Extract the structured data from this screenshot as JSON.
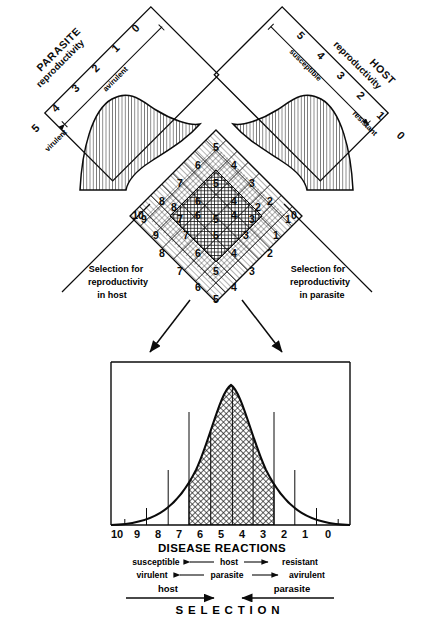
{
  "figure": {
    "panels": {
      "parasite": {
        "name": "PARASITE",
        "axis_label": "reproductivity",
        "ticks": [
          "5",
          "4",
          "3",
          "2",
          "1",
          "0"
        ],
        "low_end_label": "virulent",
        "high_end_label": "avirulent",
        "curve_fill": "diagonal-hatch"
      },
      "host": {
        "name": "HOST",
        "axis_label": "reproductivity",
        "ticks": [
          "5",
          "4",
          "3",
          "2",
          "1",
          "0"
        ],
        "low_end_label": "susceptible",
        "high_end_label": "resistant",
        "curve_fill": "diagonal-hatch"
      }
    },
    "lattice": {
      "note": "Diamond matrix of disease reaction classes; value = parasite index + host index",
      "rows": [
        [
          "5"
        ],
        [
          "6",
          "4"
        ],
        [
          "7",
          "5",
          "3"
        ],
        [
          "8",
          "6",
          "4",
          "2"
        ],
        [
          "9",
          "7",
          "5",
          "3",
          "1"
        ],
        [
          "10",
          "8",
          "6",
          "4",
          "2",
          "0"
        ],
        [
          "9",
          "7",
          "5",
          "3",
          "1"
        ],
        [
          "8",
          "6",
          "4",
          "2"
        ],
        [
          "7",
          "5",
          "3"
        ],
        [
          "6",
          "4"
        ],
        [
          "5"
        ]
      ]
    },
    "selection_left": {
      "line1": "Selection for",
      "line2": "reproductivity",
      "line3": "in host"
    },
    "selection_right": {
      "line1": "Selection for",
      "line2": "reproductivity",
      "line3": "in parasite"
    },
    "distribution": {
      "axis_title": "DISEASE  REACTIONS",
      "ticks": [
        "10",
        "9",
        "8",
        "7",
        "6",
        "5",
        "4",
        "3",
        "2",
        "1",
        "0"
      ],
      "shaded_from_tick": "6",
      "shaded_to_tick": "4",
      "shaded_fill": "cross-hatch",
      "host_scale": {
        "left": "susceptible",
        "middle": "host",
        "right": "resistant"
      },
      "parasite_scale": {
        "left": "virulent",
        "middle": "parasite",
        "right": "avirulent"
      },
      "selection": {
        "title": "S E L E C T I O N",
        "left_arrow_label": "host",
        "right_arrow_label": "parasite"
      }
    },
    "colors": {
      "ink": "#0b0b0b",
      "paper": "#ffffff",
      "hatch": "#1a1a1a"
    }
  }
}
